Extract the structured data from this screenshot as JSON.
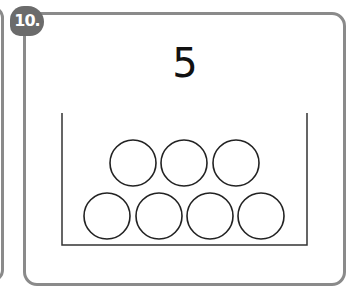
{
  "card": {
    "badge_label": "10.",
    "number": "5",
    "container": {
      "left": 62,
      "right": 307,
      "top": 113,
      "bottom": 245
    },
    "circles": [
      {
        "cx": 133,
        "cy": 163,
        "r": 23
      },
      {
        "cx": 184,
        "cy": 163,
        "r": 23
      },
      {
        "cx": 236,
        "cy": 163,
        "r": 23
      },
      {
        "cx": 107,
        "cy": 216,
        "r": 23
      },
      {
        "cx": 159,
        "cy": 216,
        "r": 23
      },
      {
        "cx": 210,
        "cy": 216,
        "r": 23
      },
      {
        "cx": 261,
        "cy": 216,
        "r": 23
      }
    ],
    "circle_count": 7
  },
  "colors": {
    "frame": "#8a8a8a",
    "badge": "#6b6b6b",
    "ink": "#222222"
  }
}
